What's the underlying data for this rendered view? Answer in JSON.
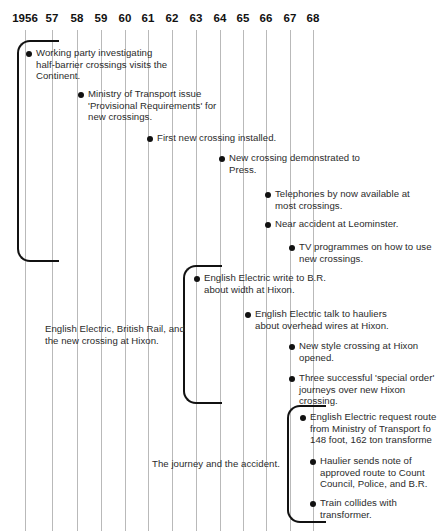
{
  "figure": {
    "background_color": "#ffffff",
    "line_color": "#111111",
    "gridline_color": "#b9b9b9"
  },
  "axis": {
    "years": [
      {
        "label": "1956",
        "x": 25
      },
      {
        "label": "57",
        "x": 52
      },
      {
        "label": "58",
        "x": 77
      },
      {
        "label": "59",
        "x": 101
      },
      {
        "label": "60",
        "x": 125
      },
      {
        "label": "61",
        "x": 148
      },
      {
        "label": "62",
        "x": 172
      },
      {
        "label": "63",
        "x": 196
      },
      {
        "label": "64",
        "x": 220
      },
      {
        "label": "65",
        "x": 243
      },
      {
        "label": "66",
        "x": 266
      },
      {
        "label": "67",
        "x": 290
      },
      {
        "label": "68",
        "x": 313
      }
    ]
  },
  "brackets": [
    {
      "name": "bracket-working-party",
      "x": 17,
      "y": 40,
      "width": 42,
      "height": 222
    },
    {
      "name": "bracket-english-electric",
      "x": 183,
      "y": 265,
      "width": 39,
      "height": 139
    },
    {
      "name": "bracket-journey",
      "x": 287,
      "y": 405,
      "width": 39,
      "height": 118
    }
  ],
  "events": [
    {
      "id": "working-party-continent",
      "text": "Working party investigating\nhalf-barrier crossings visits the\nContinent.",
      "x": 26,
      "y": 47,
      "width": 180
    },
    {
      "id": "ministry-provisional-requirements",
      "text": "Ministry of Transport issue\n'Provisional Requirements' for\nnew crossings.",
      "x": 78,
      "y": 88,
      "width": 190
    },
    {
      "id": "first-new-crossing-installed",
      "text": "First new crossing installed.",
      "x": 147,
      "y": 132,
      "width": 190
    },
    {
      "id": "new-crossing-demonstrated",
      "text": "New crossing demonstrated to\nPress.",
      "x": 219,
      "y": 152,
      "width": 195
    },
    {
      "id": "telephones-available",
      "text": "Telephones by now available at\nmost crossings.",
      "x": 265,
      "y": 188,
      "width": 175
    },
    {
      "id": "near-accident-leominster",
      "text": "Near accident at Leominster.",
      "x": 265,
      "y": 218,
      "width": 175
    },
    {
      "id": "tv-programmes",
      "text": "TV programmes on how to use\nnew crossings.",
      "x": 289,
      "y": 241,
      "width": 160
    },
    {
      "id": "ee-write-to-br",
      "text": "English Electric write to B.R.\nabout width at Hixon.",
      "x": 194,
      "y": 272,
      "width": 200
    },
    {
      "id": "ee-talk-to-hauliers",
      "text": "English Electric talk to hauliers\nabout overhead wires at Hixon.",
      "x": 245,
      "y": 308,
      "width": 195
    },
    {
      "id": "new-style-crossing-opened",
      "text": "New style crossing at Hixon\nopened.",
      "x": 289,
      "y": 340,
      "width": 160
    },
    {
      "id": "three-special-order-journeys",
      "text": "Three successful 'special order'\njourneys over new Hixon\ncrossing.",
      "x": 289,
      "y": 372,
      "width": 160
    },
    {
      "id": "ee-request-routes",
      "text": "English Electric request route\nfrom Ministry of Transport fo\n148 foot, 162 ton transforme",
      "x": 300,
      "y": 411,
      "width": 150
    },
    {
      "id": "haulier-sends-note",
      "text": "Haulier sends note of\napproved route to Count\nCouncil, Police, and B.R.",
      "x": 310,
      "y": 455,
      "width": 140
    },
    {
      "id": "train-collides",
      "text": "Train collides with\ntransformer.",
      "x": 310,
      "y": 497,
      "width": 140
    }
  ],
  "captions": [
    {
      "id": "caption-english-electric-br-hixon",
      "text": "English Electric, British Rail, and\nthe new crossing at Hixon.",
      "x": 45,
      "y": 323,
      "width": 200
    },
    {
      "id": "caption-journey-accident",
      "text": "The journey and the accident.",
      "x": 152,
      "y": 458,
      "width": 200
    }
  ]
}
